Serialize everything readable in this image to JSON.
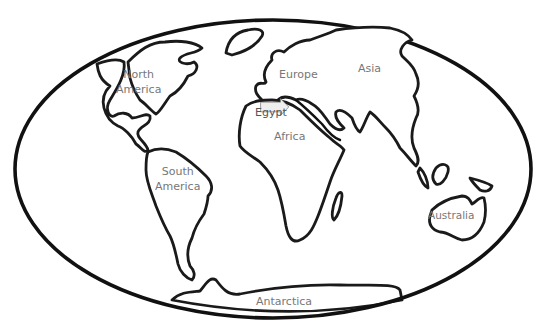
{
  "map": {
    "type": "world-outline-map",
    "colors": {
      "background": "#ffffff",
      "outline": "#111111",
      "label": "#777777",
      "callout_fill": "#eeeeee"
    },
    "continents": [
      {
        "id": "north-america",
        "label_lines": [
          "North",
          "America"
        ]
      },
      {
        "id": "south-america",
        "label_lines": [
          "South",
          "America"
        ]
      },
      {
        "id": "europe",
        "label_lines": [
          "Europe"
        ]
      },
      {
        "id": "asia",
        "label_lines": [
          "Asia"
        ]
      },
      {
        "id": "africa",
        "label_lines": [
          "Africa"
        ]
      },
      {
        "id": "australia",
        "label_lines": [
          "Australia"
        ]
      },
      {
        "id": "antarctica",
        "label_lines": [
          "Antarctica"
        ]
      }
    ],
    "callout": {
      "label": "Egypt",
      "shape": "arrow-right"
    }
  }
}
